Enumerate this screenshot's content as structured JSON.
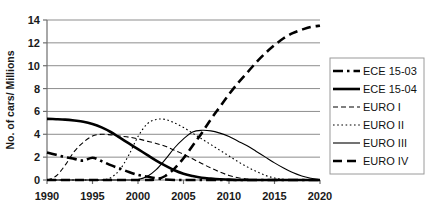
{
  "chart_data": {
    "type": "line",
    "title": "",
    "xlabel": "",
    "ylabel": "No. of cars/ Millions",
    "xlim": [
      1990,
      2020
    ],
    "ylim": [
      0,
      14
    ],
    "xticks": [
      "1990",
      "1995",
      "2000",
      "2005",
      "2010",
      "2015",
      "2020"
    ],
    "yticks": [
      "0",
      "2",
      "4",
      "6",
      "8",
      "10",
      "12",
      "14"
    ],
    "grid": true,
    "legend_position": "right",
    "x": [
      1990,
      1991,
      1992,
      1993,
      1994,
      1995,
      1996,
      1997,
      1998,
      1999,
      2000,
      2001,
      2002,
      2003,
      2004,
      2005,
      2006,
      2007,
      2008,
      2009,
      2010,
      2011,
      2012,
      2013,
      2014,
      2015,
      2016,
      2017,
      2018,
      2019,
      2020
    ],
    "series": [
      {
        "name": "ECE 15-03",
        "style": "dash-dot",
        "width": "thick",
        "color": "#000000",
        "values": [
          2.4,
          2.2,
          2.0,
          1.85,
          1.7,
          1.95,
          1.65,
          1.3,
          1.0,
          0.7,
          0.45,
          0.3,
          0.15,
          0.05,
          0.0,
          0.0,
          0.0,
          0.0,
          0.0,
          0.0,
          0.0,
          0.0,
          0.0,
          0.0,
          0.0,
          0.0,
          0.0,
          0.0,
          0.0,
          0.0,
          0.0
        ]
      },
      {
        "name": "ECE 15-04",
        "style": "solid",
        "width": "thick",
        "color": "#000000",
        "values": [
          5.35,
          5.32,
          5.28,
          5.2,
          5.1,
          4.9,
          4.6,
          4.2,
          3.7,
          3.2,
          2.7,
          2.2,
          1.7,
          1.25,
          0.85,
          0.55,
          0.35,
          0.2,
          0.12,
          0.06,
          0.03,
          0.0,
          0.0,
          0.0,
          0.0,
          0.0,
          0.0,
          0.0,
          0.0,
          0.0,
          0.0
        ]
      },
      {
        "name": "EURO I",
        "style": "dashed",
        "width": "thin",
        "color": "#000000",
        "values": [
          0.0,
          0.35,
          1.3,
          2.5,
          3.3,
          3.85,
          4.0,
          3.95,
          3.85,
          3.75,
          3.6,
          3.4,
          3.2,
          2.95,
          2.6,
          2.25,
          1.85,
          1.45,
          1.05,
          0.7,
          0.4,
          0.2,
          0.08,
          0.0,
          0.0,
          0.0,
          0.0,
          0.0,
          0.0,
          0.0,
          0.0
        ]
      },
      {
        "name": "EURO II",
        "style": "dotted",
        "width": "thin",
        "color": "#000000",
        "values": [
          0.0,
          0.0,
          0.0,
          0.0,
          0.0,
          0.0,
          0.0,
          0.2,
          0.9,
          2.2,
          3.8,
          4.9,
          5.3,
          5.3,
          5.0,
          4.6,
          4.1,
          3.6,
          3.1,
          2.6,
          2.1,
          1.6,
          1.15,
          0.75,
          0.4,
          0.18,
          0.05,
          0.0,
          0.0,
          0.0,
          0.0
        ]
      },
      {
        "name": "EURO III",
        "style": "solid",
        "width": "thin",
        "color": "#000000",
        "values": [
          0.0,
          0.0,
          0.0,
          0.0,
          0.0,
          0.0,
          0.0,
          0.0,
          0.0,
          0.0,
          0.05,
          0.3,
          0.9,
          1.8,
          2.8,
          3.6,
          4.2,
          4.35,
          4.3,
          4.1,
          3.8,
          3.4,
          3.0,
          2.5,
          2.0,
          1.5,
          1.05,
          0.65,
          0.35,
          0.15,
          0.0
        ]
      },
      {
        "name": "EURO IV",
        "style": "dashed",
        "width": "thick",
        "color": "#000000",
        "values": [
          0.0,
          0.0,
          0.0,
          0.0,
          0.0,
          0.0,
          0.0,
          0.0,
          0.0,
          0.0,
          0.0,
          0.0,
          0.05,
          0.35,
          1.0,
          1.9,
          3.0,
          4.1,
          5.3,
          6.4,
          7.5,
          8.5,
          9.4,
          10.3,
          11.1,
          11.8,
          12.4,
          12.85,
          13.15,
          13.4,
          13.5
        ]
      }
    ]
  },
  "legend": {
    "items": [
      {
        "label": "ECE 15-03",
        "style": "dash-dot",
        "width": "thick"
      },
      {
        "label": "ECE 15-04",
        "style": "solid",
        "width": "thick"
      },
      {
        "label": "EURO I",
        "style": "dashed",
        "width": "thin"
      },
      {
        "label": "EURO II",
        "style": "dotted",
        "width": "thin"
      },
      {
        "label": "EURO III",
        "style": "solid",
        "width": "thin"
      },
      {
        "label": "EURO IV",
        "style": "dashed",
        "width": "thick"
      }
    ]
  }
}
